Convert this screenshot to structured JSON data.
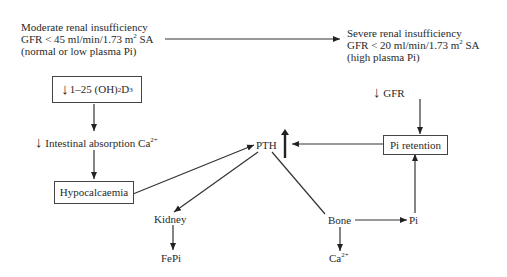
{
  "diagram": {
    "moderate": {
      "line1": "Moderate renal insufficiency",
      "line2_pre": "GFR < 45 ml/min/1.73 m",
      "line2_sup": "2",
      "line2_post": " SA",
      "line3": "(normal or low plasma Pi)"
    },
    "severe": {
      "line1": "Severe renal insufficiency",
      "line2_pre": "GFR < 20 ml/min/1.73 m",
      "line2_sup": "2",
      "line2_post": " SA",
      "line3": "(high plasma Pi)"
    },
    "vitd_box": {
      "arrow": "↓",
      "pre": "1–25 (OH)",
      "sub": "2",
      "mid": " D",
      "sub2": "3"
    },
    "intestinal": {
      "arrow": "↓",
      "text": "Intestinal absorption Ca",
      "sup": "2+"
    },
    "hypocalcaemia": "Hypocalcaemia",
    "pth": {
      "label": "PTH",
      "arrow": "↑"
    },
    "gfr": {
      "arrow": "↓",
      "label": "GFR"
    },
    "pi_retention": "Pi retention",
    "kidney": "Kidney",
    "fepi": "FePi",
    "bone": "Bone",
    "pi": "Pi",
    "ca": {
      "label": "Ca",
      "sup": "2+"
    }
  }
}
